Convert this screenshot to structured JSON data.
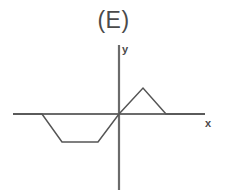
{
  "figure": {
    "title": "(E)",
    "width": 227,
    "height": 196,
    "background_color": "#ffffff",
    "line_color": "#555555",
    "axis_color": "#6b6b6b",
    "text_color": "#4a4a4a"
  },
  "axes": {
    "x_label": "x",
    "y_label": "y",
    "origin_px": [
      119,
      114
    ],
    "x_axis_px": {
      "y": 114,
      "x_start": 13,
      "x_end": 205
    },
    "y_axis_px": {
      "x": 119,
      "y_start": 45,
      "y_end": 190
    },
    "grid": false,
    "tick_labels": []
  },
  "chart_data": {
    "type": "line",
    "title": "(E)",
    "xlabel": "x",
    "ylabel": "y",
    "grid": false,
    "legend": null,
    "xlim": [
      -7.5,
      6.2
    ],
    "ylim": [
      -5.5,
      5.0
    ],
    "series": [
      {
        "name": "f(x)",
        "color": "#555555",
        "x": [
          -7.5,
          -5.5,
          -4.0,
          -1.5,
          0.0,
          1.7,
          3.3,
          6.2
        ],
        "y": [
          0.0,
          0.0,
          -2.0,
          -2.0,
          0.0,
          2.0,
          0.0,
          0.0
        ],
        "points_px": [
          [
            13,
            114
          ],
          [
            42,
            114
          ],
          [
            62,
            142
          ],
          [
            98,
            142
          ],
          [
            119,
            114
          ],
          [
            143,
            88
          ],
          [
            166,
            114
          ],
          [
            205,
            114
          ]
        ]
      }
    ]
  }
}
